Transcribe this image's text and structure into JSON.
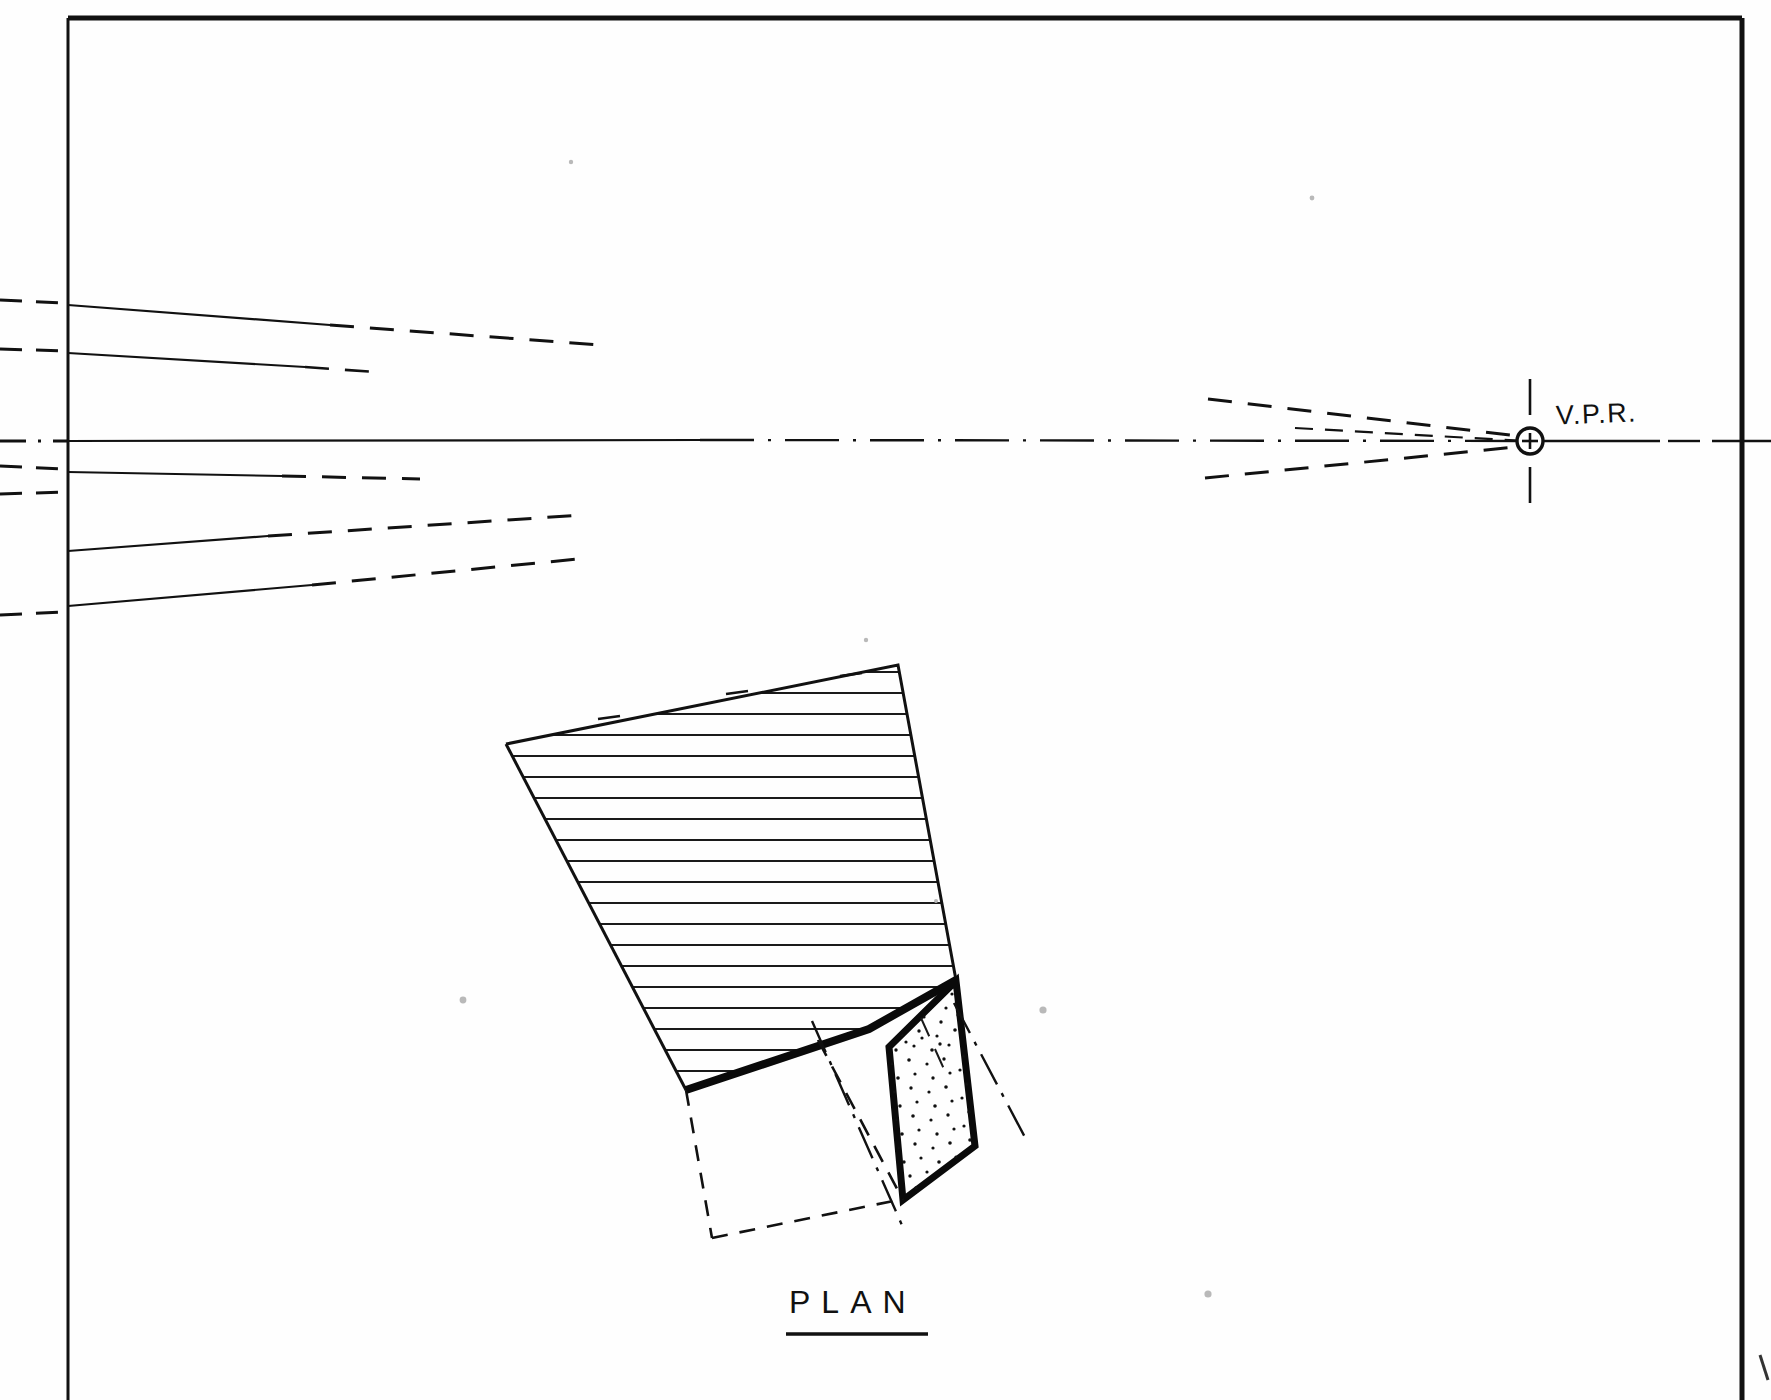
{
  "drawing": {
    "title_hidden": "",
    "type": "two-point perspective construction drawing",
    "background_color": "#fefefe",
    "ink_color": "#111111",
    "labels": {
      "vanishing_point_right": "V.P.R.",
      "plan": "PLAN"
    },
    "border": {
      "left_x": 68,
      "top_y": 18,
      "right_x": 1742,
      "bottom_y": 1400,
      "stroke_width": 5
    },
    "vanishing_point": {
      "name": "V.P.R.",
      "x": 1530,
      "y": 441,
      "radius": 13,
      "crosshair_length": 62
    },
    "horizon_line": {
      "y": 441,
      "style": "dash-dot",
      "x_start": 0,
      "x_end": 1771
    },
    "convergence_lines": [
      {
        "id": "line-1",
        "left_y": 305,
        "solid_to_x": 330,
        "note": "upper converging line"
      },
      {
        "id": "line-2",
        "left_y": 353,
        "solid_to_x": 305,
        "note": "upper converging line"
      },
      {
        "id": "line-3",
        "left_y": 441,
        "solid_to_x": 700,
        "note": "horizon / eye level"
      },
      {
        "id": "line-4",
        "left_y": 472,
        "solid_to_x": 282,
        "note": "lower converging line"
      },
      {
        "id": "line-5",
        "left_y": 551,
        "solid_to_x": 268,
        "note": "lower converging line"
      },
      {
        "id": "line-6",
        "left_y": 606,
        "solid_to_x": 312,
        "note": "lower converging line"
      }
    ],
    "plan_shape": {
      "name": "hatched-roof-plane",
      "fill": "none",
      "hatch_spacing": 22,
      "hatch_count": 21,
      "vertices": [
        {
          "x": 506,
          "y": 744
        },
        {
          "x": 898,
          "y": 665
        },
        {
          "x": 956,
          "y": 980
        },
        {
          "x": 869,
          "y": 1029
        },
        {
          "x": 686,
          "y": 1090
        }
      ]
    },
    "stippled_shape": {
      "name": "stippled-floor-plane",
      "dot_count": 120,
      "vertices": [
        {
          "x": 889,
          "y": 1047
        },
        {
          "x": 956,
          "y": 981
        },
        {
          "x": 975,
          "y": 1146
        },
        {
          "x": 903,
          "y": 1200
        }
      ]
    },
    "annotations": {
      "dashed_projection_lines": 5,
      "dash_dot_center_lines": 2
    }
  }
}
